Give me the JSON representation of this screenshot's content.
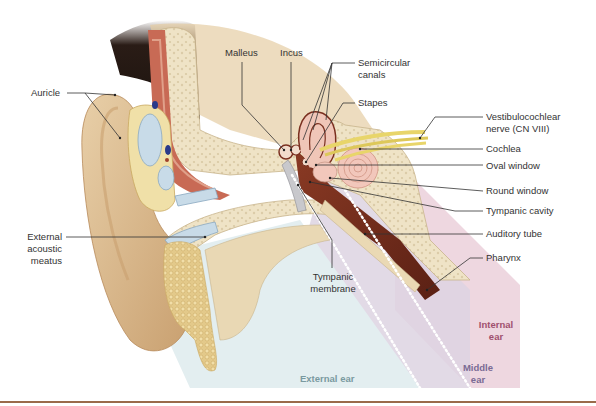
{
  "figure": {
    "colors": {
      "external_ear_region": "#e3eef0",
      "middle_ear_region": "#dcd4e4",
      "internal_ear_region": "#ecd3dd",
      "bone": "#efe3c6",
      "skin": "#d9b98f",
      "cartilage": "#c8dbe8",
      "cavity": "#7a2e1e",
      "nerve": "#e8d56a",
      "cochlea": "#f2c7bb",
      "label_text": "#333333",
      "external_ear_text": "#7a9aa0",
      "middle_ear_text": "#7a6a94",
      "internal_ear_text": "#a0506e",
      "rule": "#9a6a4a"
    }
  },
  "labels": {
    "auricle": "Auricle",
    "external_acoustic_meatus": [
      "External",
      "acoustic",
      "meatus"
    ],
    "malleus": "Malleus",
    "incus": "Incus",
    "semicircular_canals": [
      "Semicircular",
      "canals"
    ],
    "stapes": "Stapes",
    "vestibulocochlear_nerve": [
      "Vestibulocochlear",
      "nerve (CN VIII)"
    ],
    "cochlea": "Cochlea",
    "oval_window": "Oval window",
    "round_window": "Round window",
    "tympanic_cavity": "Tympanic cavity",
    "auditory_tube": "Auditory tube",
    "pharynx": "Pharynx",
    "tympanic_membrane": [
      "Tympanic",
      "membrane"
    ]
  },
  "regions": {
    "external_ear": "External ear",
    "middle_ear": [
      "Middle",
      "ear"
    ],
    "internal_ear": [
      "Internal",
      "ear"
    ]
  }
}
